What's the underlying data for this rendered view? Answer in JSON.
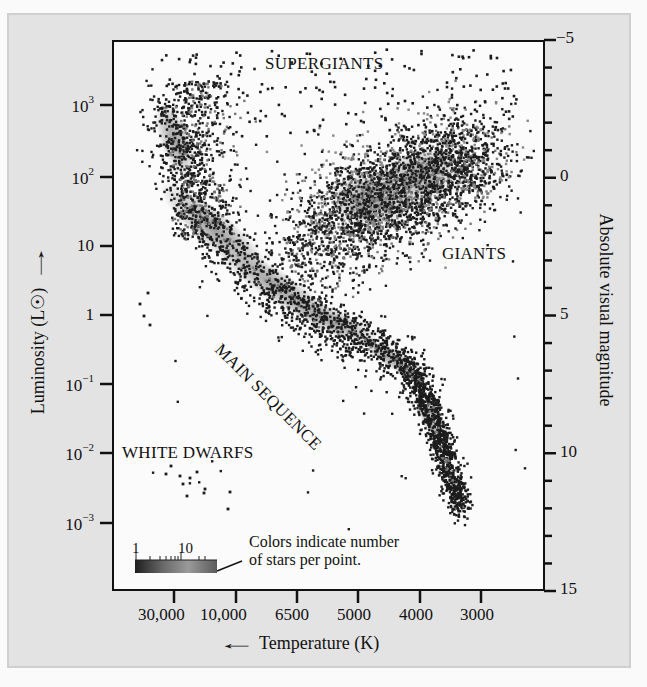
{
  "chart_data": {
    "type": "scatter",
    "xlabel": "Temperature (K)",
    "xlabel_arrow": "←",
    "ylabel": "Luminosity (L☉)",
    "ylabel_arrow": "→",
    "y2label": "Absolute visual magnitude",
    "x_axis": {
      "direction": "decreasing",
      "ticks": [
        "30,000",
        "10,000",
        "6500",
        "5000",
        "4000",
        "3000"
      ]
    },
    "y_axis": {
      "scale": "log",
      "ticks": [
        {
          "base": "10",
          "exp": "3"
        },
        {
          "base": "10",
          "exp": "2"
        },
        {
          "base": "10",
          "exp": ""
        },
        {
          "base": "1",
          "exp": ""
        },
        {
          "base": "10",
          "exp": "−1"
        },
        {
          "base": "10",
          "exp": "−2"
        },
        {
          "base": "10",
          "exp": "−3"
        }
      ],
      "range": [
        0.0003,
        10000
      ]
    },
    "y2_axis": {
      "range": [
        -5,
        15
      ],
      "labeled_ticks": [
        "−5",
        "0",
        "5",
        "10",
        "15"
      ],
      "minor_step": 1
    },
    "grid": false,
    "region_labels": [
      {
        "text": "SUPERGIANTS"
      },
      {
        "text": "GIANTS"
      },
      {
        "text": "MAIN SEQUENCE"
      },
      {
        "text": "WHITE DWARFS"
      }
    ],
    "legend": {
      "colorbar_labels": [
        "1",
        "10"
      ],
      "text_line1": "Colors indicate number",
      "text_line2": "of stars per point.",
      "position": "bottom-left"
    },
    "series": [
      {
        "name": "Main sequence",
        "description": "diagonal band from hot luminous (~30,000 K, 10^3 L☉) to cool faint (~3000 K, 10^-3 L☉)",
        "approx_points": [
          [
            30000,
            1000
          ],
          [
            10000,
            30
          ],
          [
            6500,
            2
          ],
          [
            5000,
            0.4
          ],
          [
            4000,
            0.08
          ],
          [
            3200,
            0.003
          ]
        ]
      },
      {
        "name": "Giants",
        "description": "clump around ~4500–5000 K, 30–300 L☉",
        "approx_points": [
          [
            5000,
            60
          ],
          [
            4500,
            100
          ],
          [
            4000,
            200
          ],
          [
            3500,
            300
          ]
        ]
      },
      {
        "name": "Supergiants",
        "description": "sparse points across top, 10^3–10^4 L☉",
        "approx_points": [
          [
            25000,
            5000
          ],
          [
            8000,
            2000
          ],
          [
            5000,
            3000
          ],
          [
            3500,
            2000
          ]
        ]
      },
      {
        "name": "White dwarfs",
        "description": "sparse points lower left, ~10^-3–10^-2 L☉",
        "approx_points": [
          [
            25000,
            0.003
          ],
          [
            20000,
            0.005
          ],
          [
            15000,
            0.002
          ],
          [
            10000,
            0.001
          ]
        ]
      }
    ]
  },
  "colors": {
    "figure_bg": "#e3e3e3",
    "plot_bg": "#fbfbfb",
    "point_dark": "#1a1a1a",
    "point_dense": "#8a8a8a",
    "axis": "#111111"
  }
}
